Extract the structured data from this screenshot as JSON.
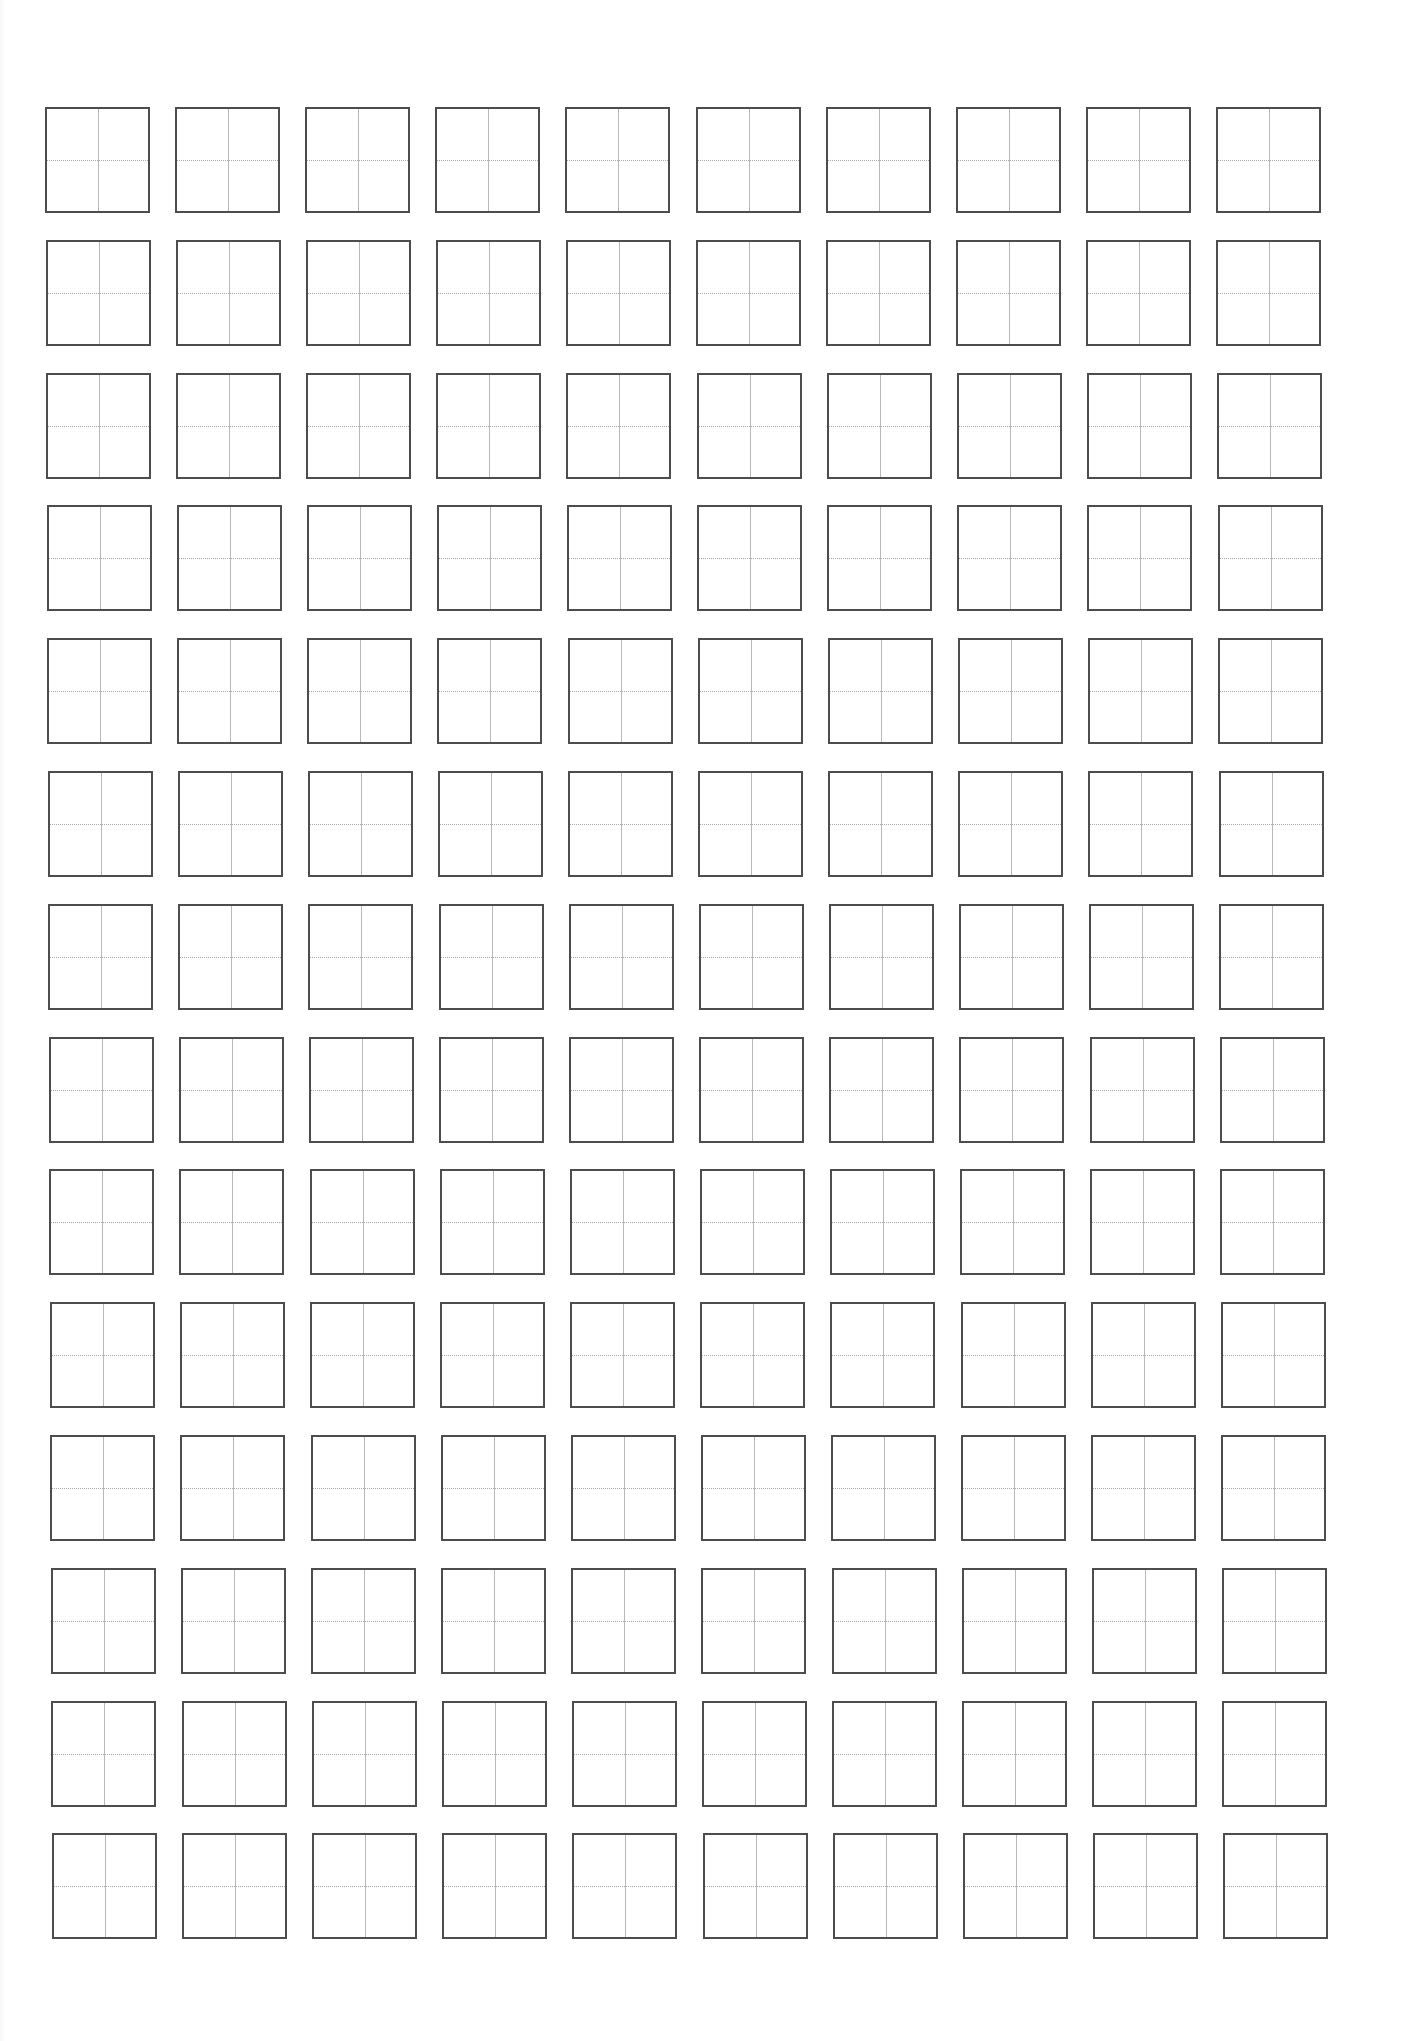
{
  "page": {
    "type": "tianzige-practice-sheet",
    "background_color": "#ffffff",
    "border_color": "#4d4d4d",
    "guide_color": "#b8b8b8"
  },
  "grid": {
    "columns": 10,
    "rows": 14,
    "origin_x": 45,
    "origin_y": 107,
    "cell_width": 105,
    "cell_height": 106,
    "column_pitch": 130.1,
    "row_pitch": 132.8,
    "drift_x_total": 7,
    "cell_content": ""
  }
}
